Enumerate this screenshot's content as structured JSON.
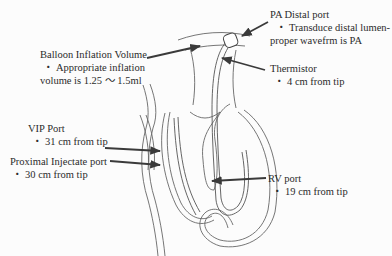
{
  "figure": {
    "labels": {
      "pa_distal": {
        "title": "PA Distal port",
        "bullet": "・",
        "line1": "Transduce distal lumen-",
        "line2": "proper wavefrm is PA"
      },
      "balloon": {
        "title": "Balloon Inflation Volume",
        "bullet": "・",
        "line1": "Appropriate inflation",
        "line2": "volume is 1.25 ～ 1.5ml"
      },
      "thermistor": {
        "title": "Thermistor",
        "bullet": "・",
        "line1": "4 cm from tip"
      },
      "vip": {
        "title": "VIP Port",
        "bullet": "・",
        "line1": "31 cm from tip"
      },
      "proximal": {
        "title": "Proximal Injectate port",
        "bullet": "・",
        "line1": "30 cm from tip"
      },
      "rv": {
        "title": "RV port",
        "bullet": "・",
        "line1": "19 cm from tip"
      }
    },
    "colors": {
      "line": "#555555",
      "arrow": "#3a3a3a",
      "text": "#2b2b2b",
      "background": "#fcfcfc"
    }
  }
}
